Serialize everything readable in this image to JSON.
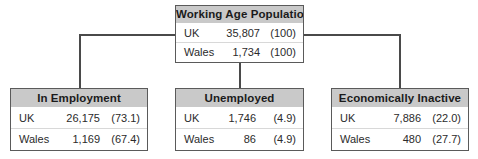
{
  "diagram": {
    "type": "flow-tree",
    "colors": {
      "header_background": "#c9c9c9",
      "box_border": "#5a5a5a",
      "connector": "#4a4a4a",
      "row_background": "#ffffff",
      "text": "#2b2b2b"
    },
    "root": {
      "id": "working-age-population",
      "header": "Working Age Population",
      "rows": [
        {
          "label": "UK",
          "value": "35,807",
          "percent": "(100)"
        },
        {
          "label": "Wales",
          "value": "1,734",
          "percent": "(100)"
        }
      ]
    },
    "children": [
      {
        "id": "in-employment",
        "header": "In Employment",
        "rows": [
          {
            "label": "UK",
            "value": "26,175",
            "percent": "(73.1)"
          },
          {
            "label": "Wales",
            "value": "1,169",
            "percent": "(67.4)"
          }
        ]
      },
      {
        "id": "unemployed",
        "header": "Unemployed",
        "rows": [
          {
            "label": "UK",
            "value": "1,746",
            "percent": "(4.9)"
          },
          {
            "label": "Wales",
            "value": "86",
            "percent": "(4.9)"
          }
        ]
      },
      {
        "id": "economically-inactive",
        "header": "Economically Inactive",
        "rows": [
          {
            "label": "UK",
            "value": "7,886",
            "percent": "(22.0)"
          },
          {
            "label": "Wales",
            "value": "480",
            "percent": "(27.7)"
          }
        ]
      }
    ]
  }
}
